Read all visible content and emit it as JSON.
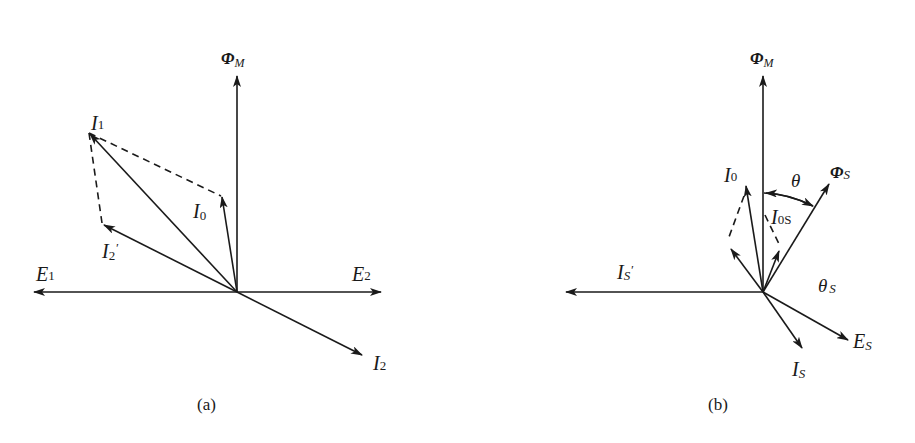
{
  "diagram_a": {
    "caption": "(a)",
    "labels": {
      "phi_m": "Φ",
      "phi_m_sub": "M",
      "i1": "I",
      "i1_sub": "1",
      "i0": "I",
      "i0_sub": "0",
      "i2p": "I",
      "i2p_sub": "2",
      "i2p_prime": "′",
      "e1": "E",
      "e1_sub": "1",
      "e2": "E",
      "e2_sub": "2",
      "i2": "I",
      "i2_sub": "2"
    }
  },
  "diagram_b": {
    "caption": "(b)",
    "labels": {
      "phi_m": "Φ",
      "phi_m_sub": "M",
      "i0": "I",
      "i0_sub": "0",
      "theta": "θ",
      "phi_s": "Φ",
      "phi_s_sub": "S",
      "i0s": "I",
      "i0s_sub": "0S",
      "is_prime": "I",
      "is_prime_sub": "S",
      "is_prime_mark": "′",
      "theta_s": "θ",
      "theta_s_sub": "S",
      "es": "E",
      "es_sub": "S",
      "is": "I",
      "is_sub": "S"
    }
  },
  "colors": {
    "ink": "#1a1a1a",
    "background": "#ffffff"
  }
}
